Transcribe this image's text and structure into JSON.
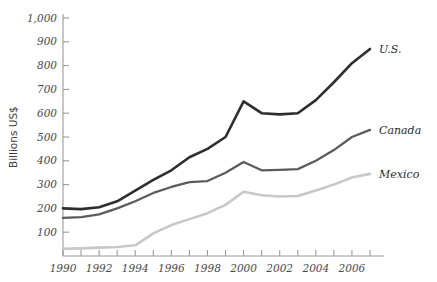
{
  "chart_data": {
    "type": "line",
    "title": "",
    "xlabel": "",
    "ylabel": "Billions US$",
    "xlim": [
      1990,
      2007
    ],
    "ylim": [
      0,
      1000
    ],
    "grid": false,
    "legend_position": "right-inline",
    "x": [
      1990,
      1991,
      1992,
      1993,
      1994,
      1995,
      1996,
      1997,
      1998,
      1999,
      2000,
      2001,
      2002,
      2003,
      2004,
      2005,
      2006,
      2007
    ],
    "xticks": [
      1990,
      1992,
      1994,
      1996,
      1998,
      2000,
      2002,
      2004,
      2006
    ],
    "xtick_labels": [
      "1990",
      "1992",
      "1994",
      "1996",
      "1998",
      "2000",
      "2002",
      "2004",
      "2006"
    ],
    "yticks": [
      100,
      200,
      300,
      400,
      500,
      600,
      700,
      800,
      900,
      1000
    ],
    "ytick_labels": [
      "100",
      "200",
      "300",
      "400",
      "500",
      "600",
      "700",
      "800",
      "900",
      "1,000"
    ],
    "series": [
      {
        "name": "U.S.",
        "color": "#2e2e2e",
        "width": 2.6,
        "values": [
          200,
          197,
          205,
          230,
          275,
          320,
          360,
          415,
          450,
          500,
          650,
          600,
          595,
          600,
          655,
          730,
          810,
          870
        ]
      },
      {
        "name": "Canada",
        "color": "#5c5c5c",
        "width": 2.3,
        "values": [
          160,
          163,
          175,
          200,
          230,
          265,
          290,
          310,
          315,
          350,
          395,
          360,
          362,
          365,
          400,
          445,
          500,
          530
        ]
      },
      {
        "name": "Mexico",
        "color": "#c8c8c8",
        "width": 2.6,
        "values": [
          30,
          32,
          35,
          38,
          45,
          95,
          130,
          155,
          180,
          215,
          270,
          255,
          250,
          252,
          275,
          300,
          330,
          345
        ]
      }
    ]
  }
}
